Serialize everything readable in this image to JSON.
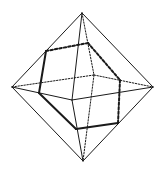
{
  "diagram": {
    "colors": {
      "line": "#1a1a1a",
      "background": "#ffffff"
    },
    "vertices": {
      "T": [
        82,
        13
      ],
      "B": [
        83,
        161
      ],
      "L": [
        12,
        87
      ],
      "R": [
        153,
        87
      ],
      "F": [
        72,
        100
      ],
      "K": [
        94,
        75
      ]
    },
    "hexagon": {
      "H1": [
        46,
        51
      ],
      "H2": [
        88,
        43
      ],
      "H3": [
        120,
        80
      ],
      "H4": [
        118,
        123
      ],
      "H5": [
        76,
        129
      ],
      "H6": [
        39,
        93
      ]
    },
    "edges_solid": [
      [
        "T",
        "L"
      ],
      [
        "T",
        "R"
      ],
      [
        "T",
        "F"
      ],
      [
        "L",
        "F"
      ],
      [
        "F",
        "R"
      ],
      [
        "L",
        "B"
      ],
      [
        "R",
        "B"
      ],
      [
        "F",
        "B"
      ]
    ],
    "edges_hidden": [
      [
        "T",
        "K"
      ],
      [
        "L",
        "K"
      ],
      [
        "K",
        "R"
      ],
      [
        "K",
        "B"
      ]
    ],
    "section_solid": [
      [
        "H1",
        "H6"
      ],
      [
        "H6",
        "H5"
      ],
      [
        "H5",
        "H4"
      ]
    ],
    "section_hidden": [
      [
        "H1",
        "H2"
      ],
      [
        "H2",
        "H3"
      ],
      [
        "H3",
        "H4"
      ]
    ]
  }
}
